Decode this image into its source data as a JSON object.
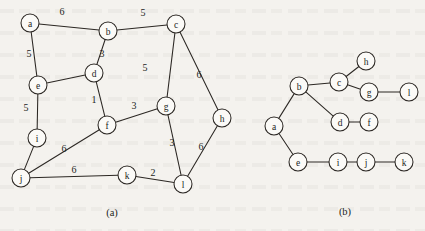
{
  "figure": {
    "background_color": "#f4f2ee",
    "ink_color": "#2b2723",
    "node_fill": "#fbfaf7",
    "node_radius": 9
  },
  "panels": [
    {
      "id": "panel-a",
      "caption": "(a)",
      "caption_pos": {
        "x": 112,
        "y": 212
      },
      "description": "weighted undirected graph",
      "nodes": [
        {
          "id": "a",
          "label": "a",
          "x": 30,
          "y": 23
        },
        {
          "id": "b",
          "label": "b",
          "x": 108,
          "y": 31
        },
        {
          "id": "c",
          "label": "c",
          "x": 176,
          "y": 24
        },
        {
          "id": "d",
          "label": "d",
          "x": 94,
          "y": 73
        },
        {
          "id": "e",
          "label": "e",
          "x": 38,
          "y": 85
        },
        {
          "id": "f",
          "label": "f",
          "x": 107,
          "y": 125
        },
        {
          "id": "g",
          "label": "g",
          "x": 166,
          "y": 106
        },
        {
          "id": "h",
          "label": "h",
          "x": 222,
          "y": 118
        },
        {
          "id": "i",
          "label": "i",
          "x": 37,
          "y": 138
        },
        {
          "id": "j",
          "label": "j",
          "x": 21,
          "y": 178
        },
        {
          "id": "k",
          "label": "k",
          "x": 127,
          "y": 175
        },
        {
          "id": "l",
          "label": "l",
          "x": 183,
          "y": 184
        }
      ],
      "edges": [
        {
          "from": "a",
          "to": "b",
          "weight": "6",
          "label_pos": {
            "x": 62,
            "y": 11
          }
        },
        {
          "from": "b",
          "to": "c",
          "weight": "5",
          "label_pos": {
            "x": 143,
            "y": 12
          }
        },
        {
          "from": "a",
          "to": "e",
          "weight": "5",
          "label_pos": {
            "x": 29,
            "y": 53
          }
        },
        {
          "from": "b",
          "to": "d",
          "weight": "3",
          "label_pos": {
            "x": 102,
            "y": 53
          }
        },
        {
          "from": "c",
          "to": "g",
          "weight": "5",
          "label_pos": {
            "x": 145,
            "y": 67
          }
        },
        {
          "from": "c",
          "to": "h",
          "weight": "6",
          "label_pos": {
            "x": 199,
            "y": 74
          }
        },
        {
          "from": "e",
          "to": "d",
          "weight": "",
          "label_pos": null
        },
        {
          "from": "d",
          "to": "f",
          "weight": "1",
          "label_pos": {
            "x": 94,
            "y": 99
          }
        },
        {
          "from": "e",
          "to": "i",
          "weight": "5",
          "label_pos": {
            "x": 26,
            "y": 107
          }
        },
        {
          "from": "f",
          "to": "g",
          "weight": "3",
          "label_pos": {
            "x": 134,
            "y": 105
          }
        },
        {
          "from": "g",
          "to": "l",
          "weight": "3",
          "label_pos": {
            "x": 172,
            "y": 142
          }
        },
        {
          "from": "h",
          "to": "l",
          "weight": "6",
          "label_pos": {
            "x": 201,
            "y": 146
          }
        },
        {
          "from": "i",
          "to": "j",
          "weight": "",
          "label_pos": null
        },
        {
          "from": "j",
          "to": "f",
          "weight": "6",
          "label_pos": {
            "x": 64,
            "y": 148
          }
        },
        {
          "from": "j",
          "to": "k",
          "weight": "6",
          "label_pos": {
            "x": 74,
            "y": 169
          }
        },
        {
          "from": "k",
          "to": "l",
          "weight": "2",
          "label_pos": {
            "x": 153,
            "y": 172
          }
        }
      ]
    },
    {
      "id": "panel-b",
      "caption": "(b)",
      "caption_pos": {
        "x": 345,
        "y": 211
      },
      "description": "spanning tree",
      "nodes": [
        {
          "id": "h",
          "label": "h",
          "x": 366,
          "y": 61
        },
        {
          "id": "c",
          "label": "c",
          "x": 339,
          "y": 82
        },
        {
          "id": "b",
          "label": "b",
          "x": 299,
          "y": 86
        },
        {
          "id": "g",
          "label": "g",
          "x": 369,
          "y": 92
        },
        {
          "id": "l",
          "label": "l",
          "x": 409,
          "y": 92
        },
        {
          "id": "d",
          "label": "d",
          "x": 340,
          "y": 122
        },
        {
          "id": "f",
          "label": "f",
          "x": 369,
          "y": 122
        },
        {
          "id": "a",
          "label": "a",
          "x": 274,
          "y": 126
        },
        {
          "id": "e",
          "label": "e",
          "x": 298,
          "y": 162
        },
        {
          "id": "i",
          "label": "i",
          "x": 338,
          "y": 162
        },
        {
          "id": "j",
          "label": "j",
          "x": 366,
          "y": 162
        },
        {
          "id": "k",
          "label": "k",
          "x": 404,
          "y": 162
        }
      ],
      "edges": [
        {
          "from": "a",
          "to": "b",
          "weight": "",
          "label_pos": null
        },
        {
          "from": "a",
          "to": "e",
          "weight": "",
          "label_pos": null
        },
        {
          "from": "b",
          "to": "c",
          "weight": "",
          "label_pos": null
        },
        {
          "from": "b",
          "to": "d",
          "weight": "",
          "label_pos": null
        },
        {
          "from": "c",
          "to": "h",
          "weight": "",
          "label_pos": null
        },
        {
          "from": "c",
          "to": "g",
          "weight": "",
          "label_pos": null
        },
        {
          "from": "g",
          "to": "l",
          "weight": "",
          "label_pos": null
        },
        {
          "from": "d",
          "to": "f",
          "weight": "",
          "label_pos": null
        },
        {
          "from": "e",
          "to": "i",
          "weight": "",
          "label_pos": null
        },
        {
          "from": "i",
          "to": "j",
          "weight": "",
          "label_pos": null
        },
        {
          "from": "j",
          "to": "k",
          "weight": "",
          "label_pos": null
        }
      ]
    }
  ]
}
